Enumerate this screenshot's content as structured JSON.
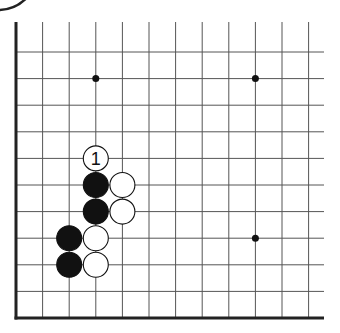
{
  "diagram": {
    "type": "go-board-corner",
    "board_color": "#ffffff",
    "line_color": "#555555",
    "edge_color": "#222222",
    "origin": {
      "x": 16,
      "y": 318
    },
    "spacing": 26.6,
    "cols": 12,
    "rows": 11,
    "star_points": [
      {
        "col": 3,
        "row": 9
      },
      {
        "col": 9,
        "row": 9
      },
      {
        "col": 9,
        "row": 3
      }
    ],
    "stones": [
      {
        "color": "white",
        "col": 3,
        "row": 6,
        "label": "1"
      },
      {
        "color": "black",
        "col": 3,
        "row": 5,
        "label": ""
      },
      {
        "color": "black",
        "col": 3,
        "row": 4,
        "label": ""
      },
      {
        "color": "white",
        "col": 4,
        "row": 5,
        "label": ""
      },
      {
        "color": "white",
        "col": 4,
        "row": 4,
        "label": ""
      },
      {
        "color": "black",
        "col": 2,
        "row": 3,
        "label": ""
      },
      {
        "color": "black",
        "col": 2,
        "row": 2,
        "label": ""
      },
      {
        "color": "white",
        "col": 3,
        "row": 3,
        "label": ""
      },
      {
        "color": "white",
        "col": 3,
        "row": 2,
        "label": ""
      }
    ],
    "move_label": "1"
  }
}
